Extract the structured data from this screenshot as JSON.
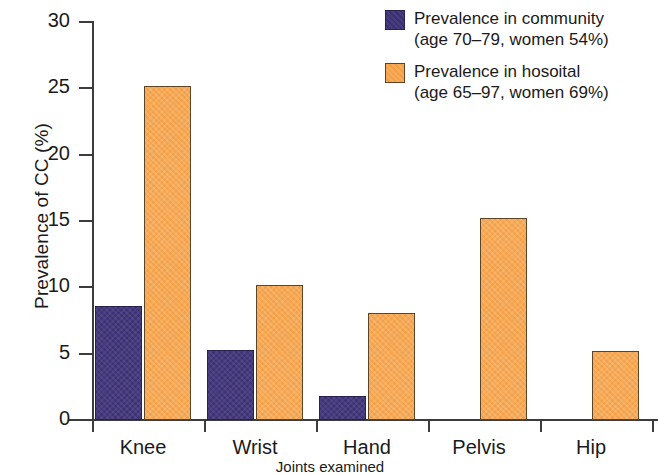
{
  "chart_data": {
    "type": "bar",
    "title": "",
    "xlabel": "Joints examined",
    "ylabel": "Prevalence of CC (%)",
    "ylim": [
      0,
      30
    ],
    "yticks": [
      0,
      5,
      10,
      15,
      20,
      25,
      30
    ],
    "ytick_labels": [
      "0",
      "5",
      "10",
      "15",
      "20",
      "25",
      "30"
    ],
    "grid": false,
    "legend_position": "top-right",
    "categories": [
      "Knee",
      "Wrist",
      "Hand",
      "Pelvis",
      "Hip"
    ],
    "series": [
      {
        "name": "Prevalence in community",
        "sub": "(age 70–79, women 54%)",
        "color": "#3d3175",
        "values": [
          8.6,
          5.3,
          1.8,
          0,
          0
        ]
      },
      {
        "name": "Prevalence in hosoital",
        "sub": "(age 65–97, women 69%)",
        "color": "#f4a045",
        "values": [
          25.2,
          10.2,
          8.1,
          15.2,
          5.2
        ]
      }
    ]
  },
  "legend": {
    "entries": [
      {
        "label": "Prevalence in community",
        "sub": "(age 70–79, women 54%)"
      },
      {
        "label": "Prevalence in hosoital",
        "sub": "(age 65–97, women 69%)"
      }
    ]
  },
  "colors": {
    "series_community": "#3d3175",
    "series_hospital": "#f4a045",
    "axis": "#3c3c3c",
    "background": "#ffffff"
  }
}
